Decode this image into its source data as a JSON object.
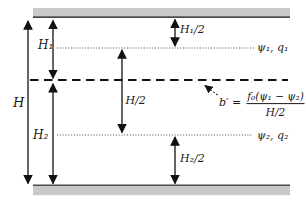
{
  "diagram": {
    "labels": {
      "total_depth": "H",
      "layer1_depth": "H₁",
      "layer2_depth": "H₂",
      "half_depth": "H/2",
      "layer1_half": "H₁/2",
      "layer2_half": "H₂/2",
      "layer1_fields": "ψ₁, q₁",
      "layer2_fields": "ψ₂, q₂"
    },
    "formula": {
      "lhs": "b′ =",
      "numerator": "f₀(ψ₁ − ψ₂)",
      "denominator": "H/2"
    },
    "colors": {
      "wall_fill": "#c9c9c9",
      "wall_edge": "#4a4a4a",
      "line": "#111111",
      "dotted_line": "#555555",
      "background": "#ffffff"
    }
  }
}
